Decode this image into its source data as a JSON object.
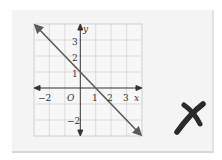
{
  "graph": {
    "axis_x_label": "x",
    "axis_y_label": "y",
    "origin_label": "O",
    "x_ticks": [
      {
        "label": "−2",
        "value": -2
      },
      {
        "label": "1",
        "value": 1
      },
      {
        "label": "2",
        "value": 2
      },
      {
        "label": "3",
        "value": 3
      }
    ],
    "y_ticks": [
      {
        "label": "3",
        "value": 3
      },
      {
        "label": "2",
        "value": 2
      },
      {
        "label": "1",
        "value": 1
      },
      {
        "label": "−2",
        "value": -2
      }
    ],
    "grid": {
      "x_range": [
        -3,
        4
      ],
      "y_range": [
        -3,
        4
      ]
    },
    "line": {
      "slope": -1,
      "intercept": 1,
      "description": "y = -x + 1"
    },
    "line_color": "#5a5a5a"
  },
  "mark": {
    "icon": "cross-mark-icon",
    "symbol": "✗",
    "color": "#2a2a2a"
  }
}
